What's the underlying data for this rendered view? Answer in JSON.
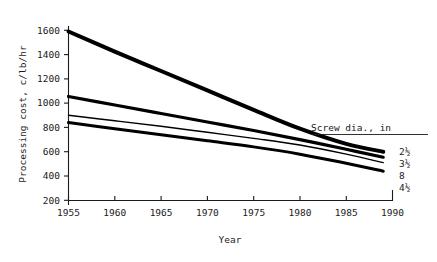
{
  "chart_data": {
    "type": "line",
    "title": "",
    "xlabel": "Year",
    "ylabel": "Processing cost, c/lb/hr",
    "xlim": [
      1955,
      1990
    ],
    "ylim": [
      200,
      1600
    ],
    "xticks": [
      1955,
      1960,
      1965,
      1970,
      1975,
      1980,
      1985,
      1990
    ],
    "yticks": [
      200,
      400,
      600,
      800,
      1000,
      1200,
      1400,
      1600
    ],
    "grid": false,
    "legend_position": "right",
    "legend_title": "Screw dia., in",
    "x": [
      1955,
      1960,
      1965,
      1970,
      1975,
      1980,
      1985,
      1989
    ],
    "series": [
      {
        "name": "2½",
        "label": "2½",
        "linewidth": 4.0,
        "values": [
          1590,
          1425,
          1265,
          1105,
          945,
          790,
          665,
          600
        ]
      },
      {
        "name": "3½",
        "label": "3½",
        "linewidth": 3.2,
        "values": [
          1055,
          985,
          915,
          845,
          775,
          700,
          620,
          555
        ]
      },
      {
        "name": "8",
        "label": "8",
        "linewidth": 1.4,
        "values": [
          900,
          855,
          810,
          760,
          710,
          655,
          580,
          510
        ]
      },
      {
        "name": "4½",
        "label": "4½",
        "linewidth": 3.0,
        "values": [
          840,
          790,
          740,
          690,
          640,
          580,
          505,
          440
        ]
      }
    ]
  },
  "axes": {
    "y_tick_labels": [
      "1600",
      "1400",
      "1200",
      "1000",
      "800",
      "600",
      "400",
      "200"
    ],
    "x_tick_labels": [
      "1955",
      "1960",
      "1965",
      "1970",
      "1975",
      "1980",
      "1985",
      "1990"
    ],
    "y_axis_title": "Processing cost, c/lb/hr",
    "x_axis_title": "Year"
  },
  "legend": {
    "title": "Screw dia., in",
    "entries": [
      {
        "label": "2½"
      },
      {
        "label": "3½"
      },
      {
        "label": "8"
      },
      {
        "label": "4½"
      }
    ]
  },
  "colors": {
    "ink": "#1a1a1a",
    "curve": "#000000",
    "background": "#ffffff"
  }
}
